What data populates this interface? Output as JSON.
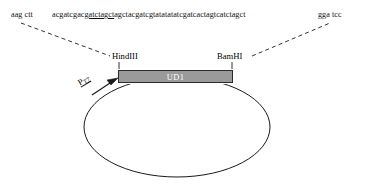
{
  "sequence": {
    "left_flank": "aag ctt",
    "core_prefix": "acgatcgac",
    "core_underlined": "gatctagct",
    "core_suffix": "agctacgatcgtatatatatcgatcactagtcatctagct",
    "right_flank": "gga tcc",
    "full": "aag ctt acgatcgacgatctagctagctacgatcgtatatatatcgatcactagtcatctagct gga tcc"
  },
  "labels": {
    "hindiii": "HindIII",
    "bamhi": "BamHI",
    "promoter": "P",
    "promoter_sub": "T7",
    "gene": "UD1"
  },
  "colors": {
    "gene_box_fill": "#9a9a9a",
    "gene_box_stroke": "#2b2b2b",
    "gene_box_text": "#ffffff",
    "line": "#1a1a1a",
    "background": "#ffffff"
  },
  "geometry": {
    "plasmid_ellipse_cx": 177,
    "plasmid_ellipse_cy": 127,
    "plasmid_ellipse_rx": 93,
    "plasmid_ellipse_ry": 50,
    "gene_box_left": 118,
    "gene_box_top": 70,
    "gene_box_width": 115,
    "gene_box_height": 13
  }
}
